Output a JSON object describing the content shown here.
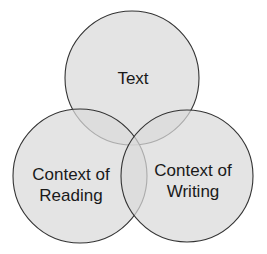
{
  "diagram": {
    "type": "venn",
    "colors": {
      "fill": "#d9d9d9",
      "stroke": "#333333",
      "text": "#1a1a1a",
      "background": "#ffffff"
    },
    "sets": [
      {
        "id": "text",
        "lines": [
          "Text"
        ]
      },
      {
        "id": "context-of-reading",
        "lines": [
          "Context of",
          "Reading"
        ]
      },
      {
        "id": "context-of-writing",
        "lines": [
          "Context of",
          "Writing"
        ]
      }
    ]
  }
}
